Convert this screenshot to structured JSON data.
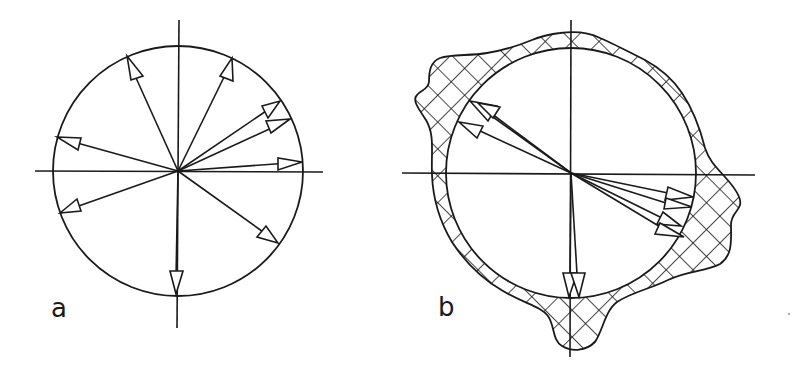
{
  "figure": {
    "panels": [
      {
        "label": "a",
        "center": [
          178,
          171
        ],
        "radius": 125,
        "axis_h": [
          35,
          323
        ],
        "axis_v": [
          20,
          328
        ],
        "arrow_tips": [
          [
            127,
            56
          ],
          [
            232,
            58
          ],
          [
            280,
            101
          ],
          [
            290,
            119
          ],
          [
            302,
            162
          ],
          [
            57,
            137
          ],
          [
            60,
            213
          ],
          [
            278,
            243
          ],
          [
            176,
            294
          ]
        ]
      },
      {
        "label": "b",
        "center": [
          571,
          173
        ],
        "radius": 125,
        "axis_h": [
          402,
          755
        ],
        "axis_v": [
          20,
          357
        ],
        "arrow_tips": [
          [
            470,
            101
          ],
          [
            478,
            103
          ],
          [
            459,
            122
          ],
          [
            693,
            197
          ],
          [
            692,
            207
          ],
          [
            681,
            226
          ],
          [
            684,
            237
          ],
          [
            569,
            297
          ],
          [
            579,
            297
          ]
        ],
        "hatched_envelope": "irregular crosshatched band surrounding circle"
      }
    ],
    "colors": {
      "ink": "#1a1a1a",
      "background": "#ffffff"
    }
  }
}
